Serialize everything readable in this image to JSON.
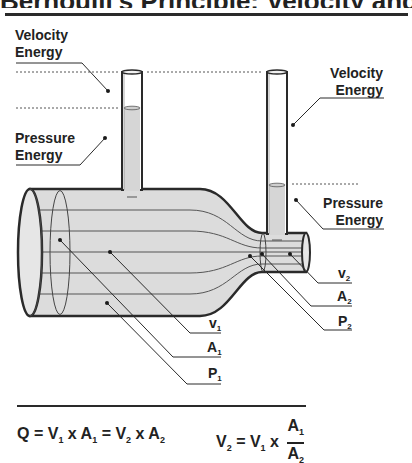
{
  "title": "Bernoulli's Principle: Velocity and Pressure",
  "labels": {
    "left_velocity": {
      "line1": "Velocity",
      "line2": "Energy"
    },
    "left_pressure": {
      "line1": "Pressure",
      "line2": "Energy"
    },
    "right_velocity": {
      "line1": "Velocity",
      "line2": "Energy"
    },
    "right_pressure": {
      "line1": "Pressure",
      "line2": "Energy"
    }
  },
  "symbols": {
    "v2": {
      "base": "v",
      "sub": "2"
    },
    "a2": {
      "base": "A",
      "sub": "2"
    },
    "p2": {
      "base": "P",
      "sub": "2"
    },
    "v1": {
      "base": "v",
      "sub": "1"
    },
    "a1": {
      "base": "A",
      "sub": "1"
    },
    "p1": {
      "base": "P",
      "sub": "1"
    }
  },
  "formulas": {
    "continuity": {
      "q": "Q",
      "eq": "=",
      "x": "x",
      "v": "V",
      "a": "A",
      "s1": "1",
      "s2": "2"
    },
    "velocity": {
      "v": "V",
      "eq": "=",
      "x": "x",
      "a": "A",
      "s1": "1",
      "s2": "2"
    }
  },
  "colors": {
    "fluid": "#d9d9d9",
    "outline": "#2a2a2a",
    "background": "#ffffff"
  }
}
